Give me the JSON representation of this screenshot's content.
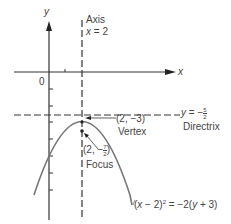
{
  "diagram": {
    "axes": {
      "x_label": "x",
      "y_label": "y",
      "origin_label": "0"
    },
    "axis_of_symmetry": {
      "label_line1": "Axis",
      "label_line2_var": "x",
      "label_line2_rest": " = 2"
    },
    "directrix": {
      "eq_var": "y",
      "eq_rest": " = −",
      "frac_num": "5",
      "frac_den": "2",
      "label": "Directrix"
    },
    "vertex": {
      "coords": "(2, −3)",
      "label": "Vertex"
    },
    "focus": {
      "coords_prefix": "(2, −",
      "frac_num": "7",
      "frac_den": "2",
      "coords_suffix": ")",
      "label": "Focus"
    },
    "equation": {
      "text_prefix": "(",
      "var_x": "x",
      "mid": " − 2)",
      "sup": "2",
      "mid2": " = −2(",
      "var_y": "y",
      "suffix": " + 3)"
    },
    "colors": {
      "curve": "#777777",
      "axes": "#333333",
      "dashed": "#333333"
    }
  }
}
